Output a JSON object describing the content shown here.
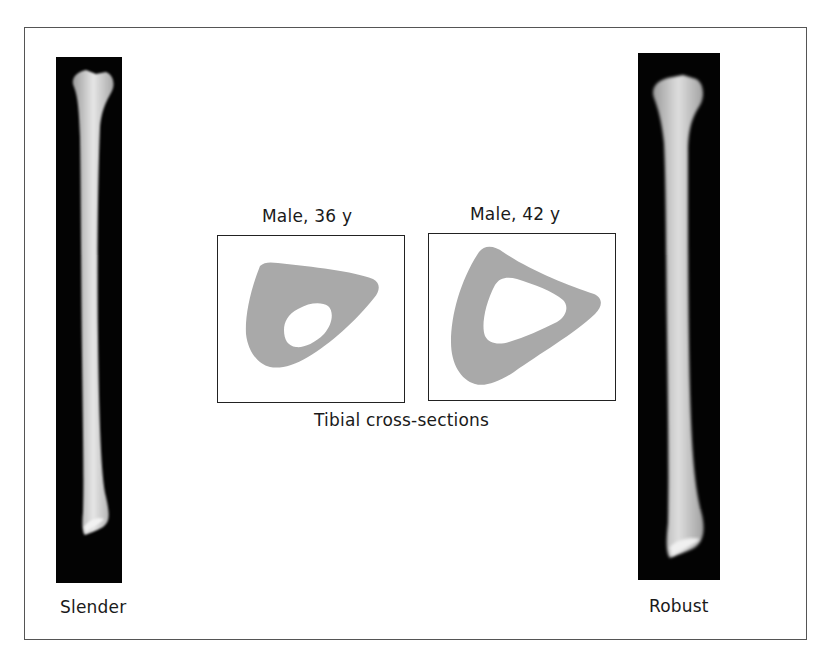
{
  "figure": {
    "left_panel": {
      "label": "Slender"
    },
    "right_panel": {
      "label": "Robust"
    },
    "cross_sections": {
      "caption": "Tibial cross-sections",
      "items": [
        {
          "title": "Male, 36 y"
        },
        {
          "title": "Male, 42 y"
        }
      ],
      "fill_color": "#a9a9a9"
    }
  }
}
